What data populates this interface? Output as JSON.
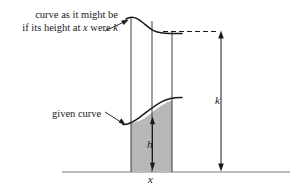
{
  "figure": {
    "type": "calculus-mean-value-diagram",
    "background_color": "#ffffff",
    "stroke_color": "#1a1a1a",
    "baseline_color": "#7a7a7a",
    "shade_color": "#b8b8b8",
    "annotations": {
      "upper_curve_note_line1": "curve as it might be",
      "upper_curve_note_line2_prefix": "if its height at ",
      "upper_curve_note_line2_var_x": "x",
      "upper_curve_note_line2_middle": " were ",
      "upper_curve_note_line2_var_k": "k",
      "given_curve_label": "given curve",
      "height_label_k": "k",
      "height_label_h": "h",
      "abscissa_label_x": "x"
    },
    "geometry": {
      "baseline_y": 172,
      "baseline_x_start": 62,
      "baseline_x_end": 290,
      "strip_left_x": 131,
      "strip_right_x": 172,
      "strip_center_x": 152,
      "k_arrow_x": 221,
      "k_arrow_top_y": 31,
      "k_arrow_bottom_y": 171,
      "h_arrow_x": 152,
      "h_arrow_top_y": 117,
      "h_arrow_bottom_y": 170,
      "dashed_line_y": 31,
      "dashed_line_x_start": 164,
      "dashed_line_x_end": 221
    }
  }
}
